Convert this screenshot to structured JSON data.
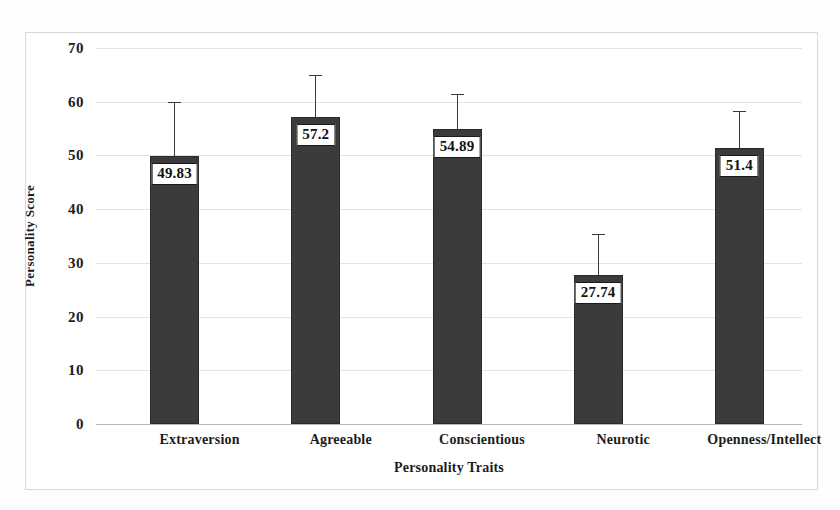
{
  "chart_data": {
    "type": "bar",
    "title": "",
    "xlabel": "Personality Traits",
    "ylabel": "Personality Score",
    "categories": [
      "Extraversion",
      "Agreeable",
      "Conscientious",
      "Neurotic",
      "Openness/Intellect"
    ],
    "values": [
      49.83,
      57.2,
      54.89,
      27.74,
      51.4
    ],
    "value_labels": [
      "49.83",
      "57.2",
      "54.89",
      "27.74",
      "51.4"
    ],
    "error_upper": [
      10.2,
      7.7,
      6.6,
      7.7,
      6.9
    ],
    "error_tops": [
      60.03,
      64.9,
      61.49,
      35.44,
      58.3
    ],
    "ylim": [
      0,
      70
    ],
    "yticks": [
      70,
      60,
      50,
      40,
      30,
      20,
      10,
      0
    ],
    "ytick_labels": [
      "70",
      "60",
      "50",
      "40",
      "30",
      "20",
      "10",
      "0"
    ],
    "grid": true,
    "legend": "none",
    "bar_color": "#3b3b3b",
    "grid_color": "#e2e2e2",
    "axis_color": "#b9b9b9",
    "text_color": "#1c1c1c"
  }
}
